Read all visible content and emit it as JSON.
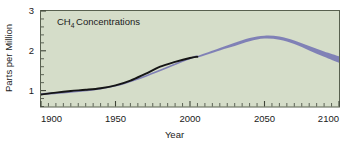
{
  "chart_data": {
    "type": "line",
    "title_prefix": "CH",
    "title_subscript": "4",
    "title_suffix": "Concentrations",
    "xlabel": "Year",
    "ylabel": "Parts per Million",
    "xlim": [
      1900,
      2100
    ],
    "ylim": [
      0.6,
      3.0
    ],
    "x_major_ticks": [
      1900,
      1950,
      2000,
      2050,
      2100
    ],
    "x_major_tick_labels": [
      "1900",
      "1950",
      "2000",
      "2050",
      "2100"
    ],
    "x_minor_tick_interval": 5,
    "y_major_ticks": [
      1,
      2,
      3
    ],
    "y_major_tick_labels": [
      "1",
      "2",
      "3"
    ],
    "y_minor_tick_interval": 0.2,
    "grid": false,
    "legend": false,
    "legend_position": "none",
    "plot_background_color": "#d5ddc9",
    "frame_color": "#58604f",
    "series": [
      {
        "name": "Observed",
        "style": "solid-line",
        "color": "#151515",
        "x": [
          1900,
          1910,
          1920,
          1930,
          1940,
          1950,
          1960,
          1970,
          1980,
          1990,
          2000,
          2005
        ],
        "values": [
          0.9,
          0.95,
          0.99,
          1.02,
          1.06,
          1.13,
          1.25,
          1.42,
          1.6,
          1.72,
          1.82,
          1.85
        ]
      },
      {
        "name": "Projected range (upper bound)",
        "style": "band-upper",
        "color": "#7b7bb5",
        "x": [
          1900,
          1950,
          2000,
          2005,
          2020,
          2030,
          2040,
          2050,
          2060,
          2070,
          2080,
          2090,
          2100
        ],
        "values": [
          0.93,
          1.14,
          1.83,
          1.87,
          2.07,
          2.2,
          2.32,
          2.38,
          2.36,
          2.26,
          2.12,
          1.98,
          1.86
        ]
      },
      {
        "name": "Projected range (lower bound)",
        "style": "band-lower",
        "color": "#7b7bb5",
        "x": [
          1900,
          1950,
          2000,
          2005,
          2020,
          2030,
          2040,
          2050,
          2060,
          2070,
          2080,
          2090,
          2100
        ],
        "values": [
          0.88,
          1.1,
          1.79,
          1.83,
          2.01,
          2.12,
          2.24,
          2.31,
          2.28,
          2.17,
          2.01,
          1.85,
          1.7
        ]
      }
    ],
    "annotations": [
      {
        "name": "historical-to-projection-transition",
        "x": 2005,
        "value": 1.85,
        "text": ""
      }
    ]
  }
}
